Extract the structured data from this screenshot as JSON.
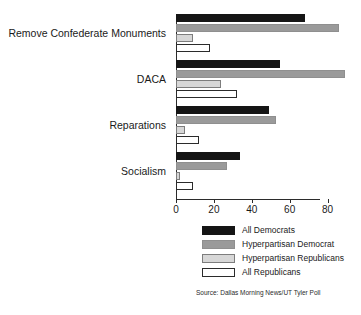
{
  "chart_data": {
    "type": "bar",
    "orientation": "horizontal",
    "title": "",
    "xlabel": "",
    "ylabel": "",
    "xlim": [
      0,
      95
    ],
    "grid": false,
    "legend_position": "bottom",
    "categories": [
      "Remove Confederate Monuments",
      "DACA",
      "Reparations",
      "Socialism"
    ],
    "series": [
      {
        "name": "All Democrats",
        "color": "#151515",
        "values": [
          68,
          55,
          49,
          34
        ]
      },
      {
        "name": "Hyperpartisan Democrat",
        "color": "#9a9a9a",
        "values": [
          86,
          89,
          53,
          27
        ]
      },
      {
        "name": "Hyperpartisan Republicans",
        "color": "#d7d7d7",
        "values": [
          9,
          24,
          5,
          2
        ]
      },
      {
        "name": "All Republicans",
        "color": "#ffffff",
        "values": [
          18,
          32,
          12,
          9
        ]
      }
    ],
    "ticks": [
      0,
      20,
      40,
      60,
      80
    ],
    "source": "Source: Dallas Morning News/UT Tyler Poll"
  },
  "legend": {
    "items": [
      {
        "label": "All Democrats"
      },
      {
        "label": "Hyperpartisan Democrat"
      },
      {
        "label": "Hyperpartisan Republicans"
      },
      {
        "label": "All Republicans"
      }
    ]
  }
}
